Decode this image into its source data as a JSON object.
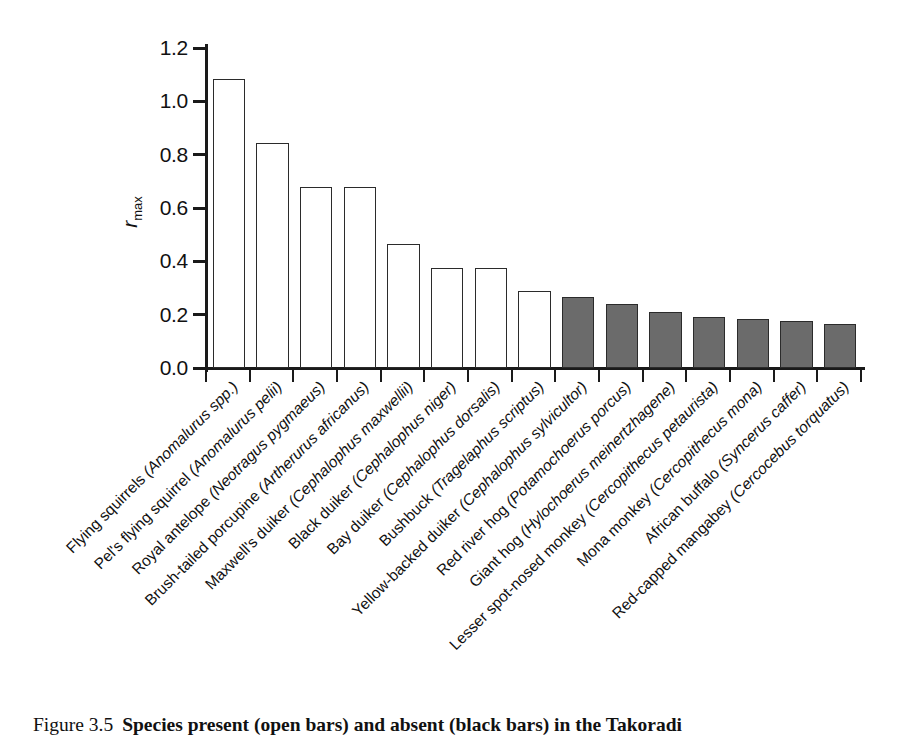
{
  "figure": {
    "caption_label": "Figure 3.5",
    "caption_text": "Species present (open bars) and absent (black bars) in the Takoradi"
  },
  "axis": {
    "y_title_symbol": "r",
    "y_title_subscript": "max"
  },
  "chart_data": {
    "type": "bar",
    "title": "",
    "xlabel": "",
    "ylabel": "r max",
    "ylim": [
      0.0,
      1.2
    ],
    "yticks": [
      "0.0",
      "0.2",
      "0.4",
      "0.6",
      "0.8",
      "1.0",
      "1.2"
    ],
    "ytick_values": [
      0.0,
      0.2,
      0.4,
      0.6,
      0.8,
      1.0,
      1.2
    ],
    "grid": false,
    "legend": [
      "open bars = species present",
      "black bars = species absent"
    ],
    "categories": [
      "Flying squirrels (Anomalurus spp.)",
      "Pel's flying squirrel (Anomalurus pelii)",
      "Royal antelope (Neotragus pygmaeus)",
      "Brush-tailed porcupine (Artherurus africanus)",
      "Maxwell's duiker (Cephalophus maxwellii)",
      "Black duiker (Cephalophus niger)",
      "Bay duiker (Cephalophus dorsalis)",
      "Bushbuck (Tragelaphus scriptus)",
      "Yellow-backed duiker (Cephalophus sylvicultor)",
      "Red river hog (Potamochoerus porcus)",
      "Giant hog (Hylochoerus meinertzhagene)",
      "Lesser spot-nosed monkey (Cercopithecus petaurista)",
      "Mona monkey (Cercopithecus mona)",
      "African buffalo (Syncerus caffer)",
      "Red-capped mangabey (Cercocebus torquatus)"
    ],
    "values": [
      1.085,
      0.845,
      0.68,
      0.68,
      0.465,
      0.375,
      0.375,
      0.29,
      0.265,
      0.24,
      0.21,
      0.19,
      0.185,
      0.175,
      0.165
    ],
    "bar_styles": [
      "open",
      "open",
      "open",
      "open",
      "open",
      "open",
      "open",
      "open",
      "solid",
      "solid",
      "solid",
      "solid",
      "solid",
      "solid",
      "solid"
    ],
    "colors": {
      "open_fill": "#ffffff",
      "solid_fill": "#6b6b6b",
      "bar_edge": "#2b2b2b",
      "axis": "#1a1a1a"
    }
  }
}
